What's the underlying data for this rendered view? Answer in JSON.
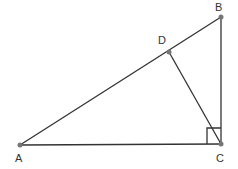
{
  "diagram": {
    "type": "geometry",
    "points": [
      {
        "id": "A",
        "label": "A"
      },
      {
        "id": "B",
        "label": "B"
      },
      {
        "id": "C",
        "label": "C"
      },
      {
        "id": "D",
        "label": "D"
      }
    ],
    "segments": [
      "AB",
      "BC",
      "AC",
      "CD"
    ],
    "right_angle_at": "C",
    "colors": {
      "line": "#333333",
      "point": "#777777"
    }
  }
}
